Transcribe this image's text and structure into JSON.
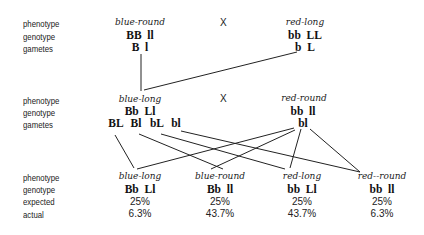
{
  "row_labels": {
    "phenotype": "phenotype",
    "genotype": "genotype",
    "gametes": "gametes",
    "expected": "expected",
    "actual": "actual"
  },
  "cross_symbol": "X",
  "parents": [
    {
      "phenotype": "blue-round",
      "genotype": "BB  ll",
      "gametes": "B  l"
    },
    {
      "phenotype": "red-long",
      "genotype": "bb  LL",
      "gametes": "b  L"
    }
  ],
  "f1": [
    {
      "phenotype": "blue-long",
      "genotype": "Bb  Ll",
      "gametes": [
        "BL",
        "Bl",
        "bL",
        "bl"
      ]
    },
    {
      "phenotype": "red-round",
      "genotype": "bb  ll",
      "gametes": [
        "bl"
      ]
    }
  ],
  "offspring": [
    {
      "phenotype": "blue-long",
      "genotype": "Bb  Ll",
      "expected": "25%",
      "actual": "6.3%"
    },
    {
      "phenotype": "blue-round",
      "genotype": "Bb  ll",
      "expected": "25%",
      "actual": "43.7%"
    },
    {
      "phenotype": "red-long",
      "genotype": "bb  Ll",
      "expected": "25%",
      "actual": "43.7%"
    },
    {
      "phenotype": "red--round",
      "genotype": "bb  ll",
      "expected": "25%",
      "actual": "6.3%"
    }
  ]
}
